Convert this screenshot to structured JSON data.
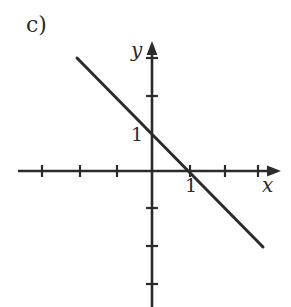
{
  "figure": {
    "part_label": "c)",
    "background_color": "#ffffff",
    "ink_color": "#2b2b2b",
    "width": 291,
    "height": 307
  },
  "axes": {
    "x_name": "x",
    "y_name": "y",
    "x_unit_label": "1",
    "y_unit_label": "1",
    "origin_px": {
      "x": 152,
      "y": 171
    },
    "unit_px": 38,
    "x_axis_start_px": 18,
    "x_axis_arrow_tip_px": 281,
    "y_axis_arrow_tip_px": 41,
    "y_axis_end_px": 307,
    "x_tick_px": [
      42,
      80,
      117,
      190,
      225,
      258
    ],
    "y_tick_px": [
      58,
      96,
      208,
      246,
      284
    ]
  },
  "chart_data": {
    "type": "line",
    "title": "c)",
    "xlabel": "x",
    "ylabel": "y",
    "grid": false,
    "legend": null,
    "xlim": [
      -3.6,
      3.4
    ],
    "ylim": [
      -3.6,
      3.4
    ],
    "xticks": [
      -3,
      -2,
      -1,
      1,
      2,
      3
    ],
    "yticks": [
      3,
      2,
      -1,
      -2,
      -3
    ],
    "xtick_labels": [
      "",
      "",
      "",
      "1",
      "",
      ""
    ],
    "ytick_labels": [
      "",
      "",
      "",
      "",
      ""
    ],
    "annotations": [
      {
        "text": "1",
        "x": 1,
        "y": 0,
        "placement": "below-axis"
      },
      {
        "text": "1",
        "x": 0,
        "y": 1,
        "placement": "left-of-axis"
      }
    ],
    "series": [
      {
        "name": "line",
        "equation": "y = -x + 1",
        "slope": -1,
        "intercept": 1,
        "x_intercept": 1,
        "y_intercept": 1,
        "x": [
          -2.0,
          2.9
        ],
        "y": [
          3.0,
          -2.0
        ],
        "endpoints_px": [
          {
            "x": 77,
            "y": 58
          },
          {
            "x": 263,
            "y": 247
          }
        ],
        "color": "#2b2b2b",
        "width_px": 3
      }
    ]
  }
}
